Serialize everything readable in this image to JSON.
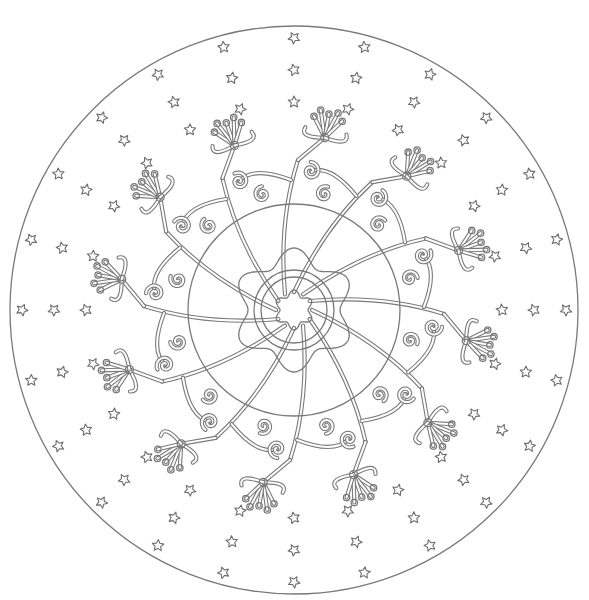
{
  "page": {
    "type": "coloring-page"
  },
  "colors": {
    "line": "#7a7a7a",
    "background": "#ffffff"
  },
  "mandala": {
    "center": [
      294,
      310
    ],
    "outer_circle_radius": 284,
    "big_ring_radius": 106,
    "flower_lobes": 6,
    "flower_radius": 60,
    "inner_rings": [
      40,
      33
    ],
    "center_flower": {
      "lobes": 6,
      "radius": 20
    },
    "stems": 12,
    "branch_flowers_per_stem": 1,
    "star_rays": 24,
    "star_radii": [
      208,
      240,
      272
    ],
    "star_size": 6
  }
}
